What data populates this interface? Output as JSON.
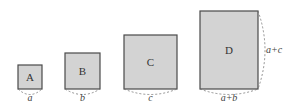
{
  "diagram": {
    "squares": [
      {
        "id": "A",
        "label": "A",
        "side_label": "a"
      },
      {
        "id": "B",
        "label": "B",
        "side_label": "b"
      },
      {
        "id": "C",
        "label": "C",
        "side_label": "c"
      },
      {
        "id": "D",
        "label": "D",
        "side_label": "a+b",
        "right_label": "a+c"
      }
    ],
    "colors": {
      "fill": "#d3d3d3",
      "stroke": "#4a4a4a"
    }
  }
}
